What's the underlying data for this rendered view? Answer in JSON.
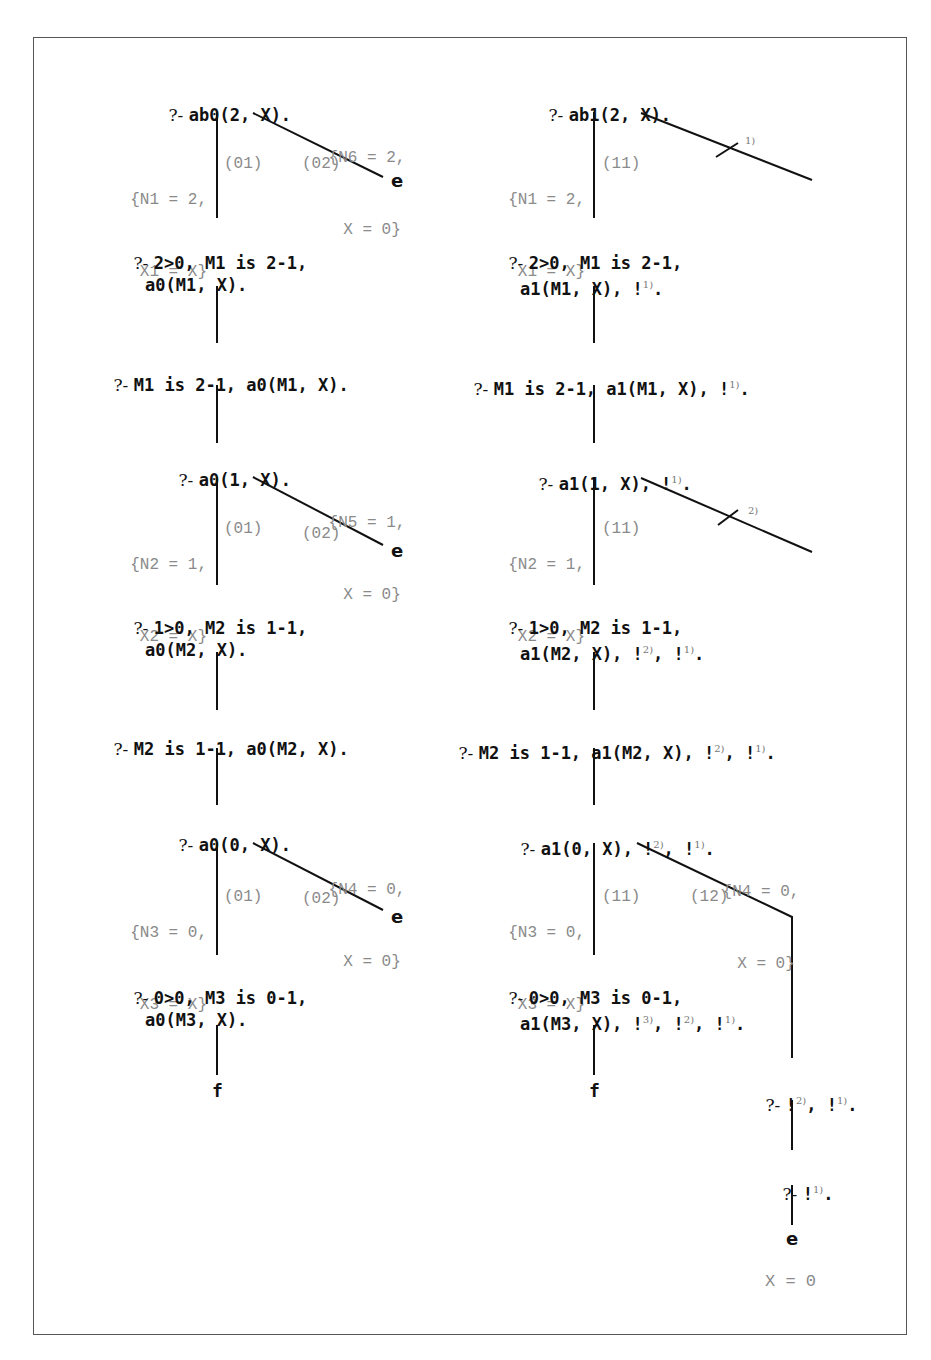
{
  "left_tree": {
    "goals": [
      {
        "prefix": "?- ",
        "text": "ab0(2, X)."
      },
      {
        "prefix": "?- ",
        "text": "2>0, M1 is 2-1,",
        "text2": "a0(M1, X)."
      },
      {
        "prefix": "?- ",
        "text": "M1 is 2-1, a0(M1, X)."
      },
      {
        "prefix": "?- ",
        "text": "a0(1, X)."
      },
      {
        "prefix": "?- ",
        "text": "1>0, M2 is 1-1,",
        "text2": "a0(M2, X)."
      },
      {
        "prefix": "?- ",
        "text": "M2 is 1-1, a0(M2, X)."
      },
      {
        "prefix": "?- ",
        "text": "a0(0, X)."
      },
      {
        "prefix": "?- ",
        "text": "0>0, M3 is 0-1,",
        "text2": "a0(M3, X)."
      }
    ],
    "substitutions": [
      {
        "line1": "{N1 = 2,",
        "line2": "X1 = X}"
      },
      {
        "line1": "{N6 = 2,",
        "line2": "X = 0}"
      },
      {
        "line1": "{N2 = 1,",
        "line2": "X2 = X}"
      },
      {
        "line1": "{N5 = 1,",
        "line2": "X = 0}"
      },
      {
        "line1": "{N3 = 0,",
        "line2": "X3 = X}"
      },
      {
        "line1": "{N4 = 0,",
        "line2": "X = 0}"
      }
    ],
    "clauses": [
      "(01)",
      "(02)"
    ],
    "terminals": {
      "end": "e",
      "fail": "f"
    }
  },
  "right_tree": {
    "goals": [
      {
        "prefix": "?- ",
        "text": "ab1(2, X)."
      },
      {
        "prefix": "?- ",
        "text": "2>0, M1 is 2-1,",
        "text2": "a1(M1, X), !",
        "sup2": "1)",
        "tail2": "."
      },
      {
        "prefix": "?- ",
        "text": "M1 is 2-1, a1(M1, X), !",
        "sup": "1)",
        "tail": "."
      },
      {
        "prefix": "?- ",
        "text": "a1(1, X), !",
        "sup": "1)",
        "tail": "."
      },
      {
        "prefix": "?- ",
        "text": "1>0, M2 is 1-1,",
        "text2": "a1(M2, X), !",
        "sup2": "2)",
        "mid2": ", !",
        "sup2b": "1)",
        "tail2": "."
      },
      {
        "prefix": "?- ",
        "text": "M2 is 1-1, a1(M2, X), !",
        "sup": "2)",
        "mid": ", !",
        "supb": "1)",
        "tail": "."
      },
      {
        "prefix": "?- ",
        "text": "a1(0, X), !",
        "sup": "2)",
        "mid": ", !",
        "supb": "1)",
        "tail": "."
      },
      {
        "prefix": "?- ",
        "text": "0>0, M3 is 0-1,",
        "text2": "a1(M3, X), !",
        "sup2": "3)",
        "mid2": ", !",
        "sup2b": "2)",
        "mid2b": ", !",
        "sup2c": "1)",
        "tail2": "."
      },
      {
        "prefix": "?- ",
        "text": "!",
        "sup": "2)",
        "mid": ", !",
        "supb": "1)",
        "tail": "."
      },
      {
        "prefix": "?- ",
        "text": "!",
        "sup": "1)",
        "tail": "."
      }
    ],
    "substitutions": [
      {
        "line1": "{N1 = 2,",
        "line2": "X1 = X}"
      },
      {
        "line1": "{N2 = 1,",
        "line2": "X2 = X}"
      },
      {
        "line1": "{N3 = 0,",
        "line2": "X3 = X}"
      },
      {
        "line1": "{N4 = 0,",
        "line2": "X = 0}"
      }
    ],
    "clauses": [
      "(11)",
      "(12)"
    ],
    "cut_marks": [
      "1)",
      "2)"
    ],
    "terminals": {
      "end": "e",
      "fail": "f"
    },
    "answer": "X = 0"
  }
}
